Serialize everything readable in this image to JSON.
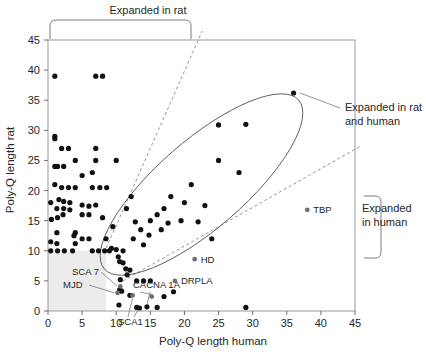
{
  "figure": {
    "title": "",
    "background": "#ffffff"
  },
  "chart_data": {
    "type": "scatter",
    "title": "",
    "xlabel": "Poly-Q length human",
    "ylabel": "Poly-Q length rat",
    "xlim": [
      0,
      45
    ],
    "ylim": [
      0,
      45
    ],
    "xticks": [
      0,
      5,
      10,
      15,
      20,
      25,
      30,
      35,
      40,
      45
    ],
    "xtick_labels": [
      "0",
      "5",
      "10",
      "15",
      "20",
      "25",
      "30",
      "35",
      "40",
      "45"
    ],
    "yticks": [
      0,
      5,
      10,
      15,
      20,
      25,
      30,
      35,
      40,
      45
    ],
    "ytick_labels": [
      "0",
      "5",
      "10",
      "15",
      "20",
      "25",
      "30",
      "35",
      "40",
      "45"
    ],
    "grid": false,
    "marker_color": "#111111",
    "points": [
      [
        1,
        39
      ],
      [
        7,
        39
      ],
      [
        8,
        39
      ],
      [
        1,
        29
      ],
      [
        1,
        28.6
      ],
      [
        2,
        27
      ],
      [
        3,
        27
      ],
      [
        7,
        27
      ],
      [
        1,
        24
      ],
      [
        1.4,
        24
      ],
      [
        2.3,
        24
      ],
      [
        4,
        25
      ],
      [
        7,
        25
      ],
      [
        10,
        25
      ],
      [
        25,
        25
      ],
      [
        28,
        23
      ],
      [
        6.5,
        23
      ],
      [
        5,
        22.5
      ],
      [
        1,
        21
      ],
      [
        2,
        20.5
      ],
      [
        3,
        20.5
      ],
      [
        4,
        20.5
      ],
      [
        6.5,
        20.5
      ],
      [
        7.6,
        20.5
      ],
      [
        8.6,
        20.5
      ],
      [
        0.4,
        18
      ],
      [
        1.6,
        18.5
      ],
      [
        2.3,
        18.2
      ],
      [
        3.2,
        18
      ],
      [
        5,
        17.6
      ],
      [
        6,
        17.4
      ],
      [
        7,
        17.6
      ],
      [
        1.3,
        17
      ],
      [
        2.3,
        17
      ],
      [
        3.2,
        16.8
      ],
      [
        0.5,
        15.2
      ],
      [
        1.4,
        15.5
      ],
      [
        2.2,
        16
      ],
      [
        5,
        16
      ],
      [
        6,
        16
      ],
      [
        8,
        15.5
      ],
      [
        1.3,
        13
      ],
      [
        4,
        13
      ],
      [
        0.4,
        11.5
      ],
      [
        1.3,
        11.2
      ],
      [
        4,
        11.2
      ],
      [
        0.4,
        10
      ],
      [
        1.4,
        10
      ],
      [
        2.4,
        10
      ],
      [
        3.6,
        10
      ],
      [
        6.5,
        10
      ],
      [
        7.4,
        10
      ],
      [
        8.3,
        10
      ],
      [
        9,
        10
      ],
      [
        9.3,
        10.4
      ],
      [
        10,
        10.2
      ],
      [
        11,
        10
      ],
      [
        10.3,
        9
      ],
      [
        10.5,
        8.2
      ],
      [
        11,
        8
      ],
      [
        11.4,
        7
      ],
      [
        12,
        6.8
      ],
      [
        11.6,
        6
      ],
      [
        10.6,
        5.2
      ],
      [
        13,
        5
      ],
      [
        14,
        5
      ],
      [
        15,
        5
      ],
      [
        10.5,
        3.5
      ],
      [
        10.8,
        3.3
      ],
      [
        12,
        2.6
      ],
      [
        17,
        2.4
      ],
      [
        10.4,
        1
      ],
      [
        13,
        0.6
      ],
      [
        13.4,
        0.5
      ],
      [
        14.5,
        0.7
      ],
      [
        16,
        0.6
      ],
      [
        29,
        0.6
      ],
      [
        12.5,
        12
      ],
      [
        13.6,
        13.5
      ],
      [
        14,
        11
      ],
      [
        15,
        15
      ],
      [
        16,
        16
      ],
      [
        17,
        17
      ],
      [
        16.6,
        13.5
      ],
      [
        18,
        19
      ],
      [
        20,
        18
      ],
      [
        21,
        21
      ],
      [
        19.5,
        15
      ],
      [
        22,
        14.8
      ],
      [
        23,
        17.5
      ],
      [
        24,
        12
      ],
      [
        25,
        30.9
      ],
      [
        29,
        31
      ],
      [
        36,
        36.2
      ],
      [
        18.4,
        3.2
      ],
      [
        12.8,
        14.8
      ],
      [
        14.8,
        12.6
      ],
      [
        17.6,
        14.6
      ],
      [
        8.5,
        12
      ],
      [
        9.5,
        14
      ],
      [
        11.5,
        17
      ],
      [
        12.2,
        19
      ],
      [
        6,
        12
      ],
      [
        5,
        12
      ],
      [
        3.8,
        12.5
      ]
    ],
    "labeled_points": [
      {
        "name": "HD",
        "x": 21.5,
        "y": 8.6,
        "label_dx": 5,
        "label_dy": 1.4
      },
      {
        "name": "DRPLA",
        "x": 18.6,
        "y": 5.0,
        "label_dx": 5,
        "label_dy": 1.4
      },
      {
        "name": "TBP",
        "x": 38.0,
        "y": 16.8,
        "label_dx": 5,
        "label_dy": 1.4
      },
      {
        "name": "SCA 7",
        "x": 10.6,
        "y": 4.1,
        "label_dx": 0,
        "label_dy": 0
      },
      {
        "name": "MJD",
        "x": 10.2,
        "y": 3.0,
        "label_dx": 0,
        "label_dy": 0
      },
      {
        "name": "CACNA 1A",
        "x": 15.2,
        "y": 2.4,
        "label_dx": 0,
        "label_dy": 0
      },
      {
        "name": "SCA1",
        "x": 12.4,
        "y": 2.6,
        "label_dx": 0,
        "label_dy": 0
      }
    ],
    "annotations": [
      {
        "id": "expanded-in-rat",
        "text": "Expanded in rat",
        "position": "top"
      },
      {
        "id": "expanded-in-rat-and-human",
        "text": "Expanded in rat\nand human",
        "line1": "Expanded in rat",
        "line2": "and human",
        "position": "right-top"
      },
      {
        "id": "expanded-in-human",
        "text": "Expanded in human",
        "line1": "Expanded",
        "line2": "in human",
        "position": "right-bottom"
      }
    ],
    "shapes": [
      {
        "id": "ellipse-rat-and-human",
        "type": "ellipse",
        "style": "solid"
      },
      {
        "id": "diagonal-upper-dashed",
        "type": "line",
        "style": "dashed"
      },
      {
        "id": "diagonal-lower-dashed",
        "type": "line",
        "style": "dashed"
      },
      {
        "id": "shaded-region-low-values",
        "type": "rect",
        "style": "filled",
        "color": "#ececec"
      }
    ]
  },
  "axis": {
    "x_title": "Poly-Q length human",
    "y_title": "Poly-Q length rat",
    "x_ticks": [
      "0",
      "5",
      "10",
      "15",
      "20",
      "25",
      "30",
      "35",
      "40",
      "45"
    ],
    "y_ticks": [
      "0",
      "5",
      "10",
      "15",
      "20",
      "25",
      "30",
      "35",
      "40",
      "45"
    ]
  },
  "labels": {
    "expanded_in_rat": "Expanded in rat",
    "expanded_rat_human_l1": "Expanded in rat",
    "expanded_rat_human_l2": "and human",
    "expanded_human_l1": "Expanded",
    "expanded_human_l2": "in human",
    "hd": "HD",
    "drpla": "DRPLA",
    "tbp": "TBP",
    "sca7": "SCA 7",
    "mjd": "MJD",
    "cacna1a": "CACNA 1A",
    "sca1": "SCA1"
  },
  "colors": {
    "marker": "#111111",
    "marker_highlight": "#6f6f6f",
    "frame": "#9a9a9a",
    "guide": "#5a5a5a",
    "shade": "#ececec"
  }
}
